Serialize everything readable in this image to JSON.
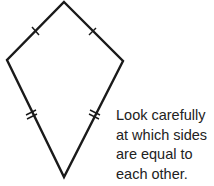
{
  "figure": {
    "shape": "kite",
    "stroke_color": "#1a1a1a",
    "vertices": {
      "top": [
        64,
        2
      ],
      "left": [
        7,
        60
      ],
      "right": [
        123,
        61
      ],
      "bottom": [
        64,
        177
      ]
    },
    "tick_marks": {
      "upper_sides": "single tick (equal)",
      "lower_sides": "double tick (equal)"
    }
  },
  "caption": {
    "lines": [
      "Look carefully",
      "at which sides",
      "are equal to",
      "each other."
    ]
  }
}
